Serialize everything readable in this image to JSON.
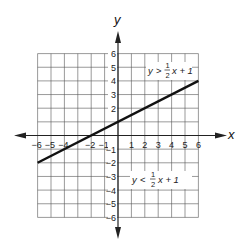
{
  "chart_data": {
    "type": "line",
    "title": "",
    "xlabel": "x",
    "ylabel": "y",
    "xlim": [
      -6,
      6
    ],
    "ylim": [
      -6,
      6
    ],
    "grid": true,
    "x_ticks": [
      -6,
      -5,
      -4,
      -2,
      -1,
      1,
      2,
      3,
      4,
      5,
      6
    ],
    "x_tick_labels": [
      "−6",
      "−5",
      "−4",
      "−2",
      "−1",
      "1",
      "2",
      "3",
      "4",
      "5",
      "6"
    ],
    "y_ticks": [
      6,
      5,
      4,
      3,
      2,
      -1,
      -2,
      -3,
      -4,
      -5,
      -6
    ],
    "y_tick_labels": [
      "6",
      "5",
      "4",
      "3",
      "2",
      "−1",
      "−2",
      "−3",
      "−4",
      "−5",
      "−6"
    ],
    "series": [
      {
        "name": "y = 1/2 x + 1",
        "x": [
          -6,
          6
        ],
        "y": [
          -2,
          4
        ],
        "slope": 0.5,
        "intercept": 1
      }
    ],
    "annotations": [
      {
        "text": "y > 1/2 x + 1",
        "region": "above line",
        "x": 3.6,
        "y": 5
      },
      {
        "text": "y < 1/2 x + 1",
        "region": "below line",
        "x": 3.6,
        "y": -3
      }
    ],
    "legend": null
  },
  "labels": {
    "x_axis": "x",
    "y_axis": "y",
    "upper_ineq": {
      "lhs": "y",
      "op": ">",
      "num": "1",
      "den": "2",
      "rhs": "x + 1"
    },
    "lower_ineq": {
      "lhs": "y",
      "op": "<",
      "num": "1",
      "den": "2",
      "rhs": "x + 1"
    }
  },
  "colors": {
    "grid": "#555555",
    "axis": "#222222",
    "line": "#111111",
    "text": "#222222"
  }
}
